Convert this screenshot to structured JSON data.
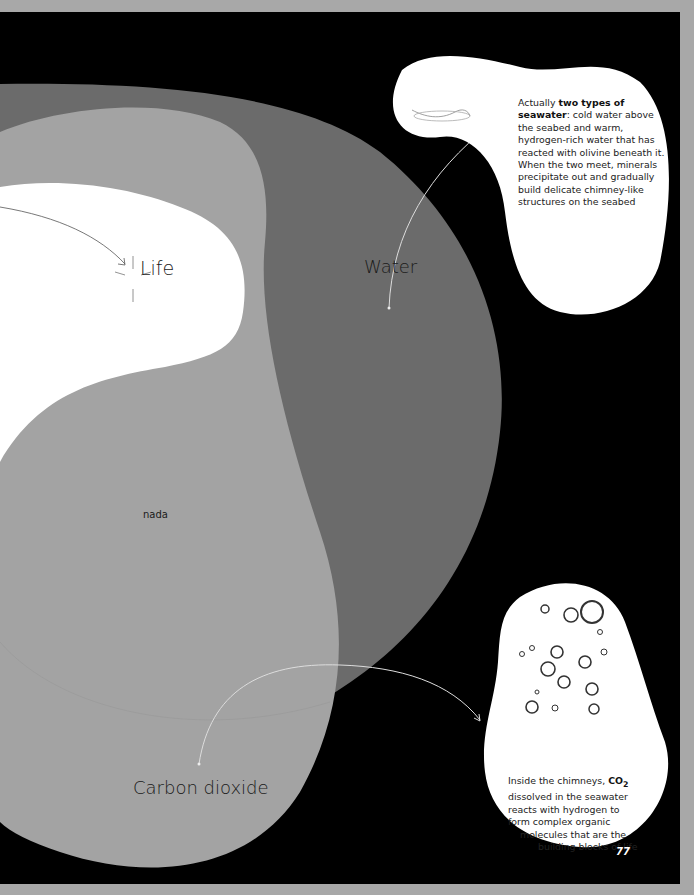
{
  "diagram": {
    "type": "venn",
    "circles": [
      {
        "id": "water",
        "label": "Water",
        "color": "#6b6b6b"
      },
      {
        "id": "carbon_dioxide",
        "label": "Carbon dioxide",
        "color": "#a3a3a3"
      },
      {
        "id": "life",
        "label": "Life",
        "color": "#ffffff"
      }
    ],
    "regions": {
      "overlap_note": "nada"
    },
    "background_color": "#000000"
  },
  "callouts": {
    "water": {
      "prefix": "Actually ",
      "bold": "two types of seawater",
      "suffix": ": cold water above the seabed and warm, hydrogen-rich water that has reacted with olivine beneath it. When the two meet, minerals precipitate out and gradually build delicate chimney-like structures on the seabed",
      "image": "water-splash"
    },
    "carbon_dioxide": {
      "prefix": "Inside the chimneys, ",
      "bold": "CO",
      "subscript": "2",
      "lines": [
        " dissolved in the seawater",
        "reacts with hydrogen to",
        "form complex organic",
        "molecules that are the",
        "building blocks of life"
      ],
      "image": "bubbles"
    }
  },
  "page_number": "77"
}
